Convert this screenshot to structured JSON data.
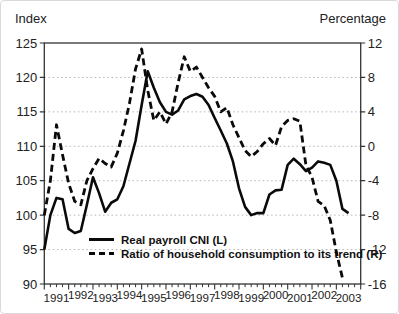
{
  "titles": {
    "left_axis": "Index",
    "right_axis": "Percentage"
  },
  "legend": {
    "items": [
      {
        "label": "Real payroll CNI (L)",
        "style": "solid"
      },
      {
        "label": "Ratio of household consumption to its trend (R)",
        "style": "dashed"
      }
    ]
  },
  "colors": {
    "line": "#0a0a0a",
    "grid": "#b8b8b8",
    "frame": "#333333",
    "text": "#222222"
  },
  "chart_data": {
    "type": "line",
    "x_start": 1991.0,
    "x_step": 0.25,
    "x_year_labels": [
      "1991",
      "1992",
      "1993",
      "1994",
      "1995",
      "1996",
      "1997",
      "1998",
      "1999",
      "2000",
      "2001",
      "2002",
      "2003"
    ],
    "left_axis": {
      "title": "Index",
      "min": 90,
      "max": 125,
      "ticks": [
        125,
        120,
        115,
        110,
        105,
        100,
        95,
        90
      ]
    },
    "right_axis": {
      "title": "Percentage",
      "min": -16,
      "max": 12,
      "ticks": [
        12,
        8,
        4,
        0,
        -4,
        -8,
        -12,
        -16
      ]
    },
    "grid": "dotted horizontal at every left-axis tick",
    "legend_position": "inside bottom-center",
    "series": [
      {
        "name": "Real payroll CNI (L)",
        "axis": "left",
        "style": "solid",
        "values": [
          95.0,
          100.0,
          102.5,
          102.3,
          98.0,
          97.4,
          97.7,
          101.5,
          105.5,
          103.2,
          100.5,
          101.8,
          102.3,
          104.2,
          107.5,
          110.8,
          116.0,
          120.9,
          118.5,
          116.4,
          115.0,
          114.6,
          115.2,
          116.8,
          117.3,
          117.6,
          117.2,
          116.0,
          114.1,
          112.3,
          110.4,
          107.8,
          103.9,
          101.2,
          100.0,
          100.3,
          100.3,
          103.0,
          103.6,
          103.7,
          107.3,
          108.2,
          107.4,
          106.4,
          106.9,
          107.8,
          107.6,
          107.3,
          105.0,
          100.9,
          100.3
        ]
      },
      {
        "name": "Ratio of household consumption to its trend (R)",
        "axis": "right",
        "style": "dashed",
        "values": [
          -8.0,
          -4.0,
          2.5,
          -1.0,
          -4.3,
          -6.4,
          -6.8,
          -4.0,
          -2.6,
          -1.4,
          -2.0,
          -2.4,
          -0.8,
          1.8,
          5.0,
          9.0,
          11.3,
          6.5,
          3.0,
          4.0,
          2.6,
          4.0,
          7.4,
          10.4,
          8.7,
          9.2,
          8.0,
          6.8,
          5.8,
          4.0,
          4.5,
          2.5,
          1.0,
          -0.5,
          -1.2,
          -0.6,
          0.3,
          0.9,
          0.1,
          2.3,
          3.0,
          3.2,
          2.9,
          -2.2,
          -3.6,
          -6.4,
          -6.9,
          -8.6,
          -12.3,
          -15.3
        ]
      }
    ]
  }
}
